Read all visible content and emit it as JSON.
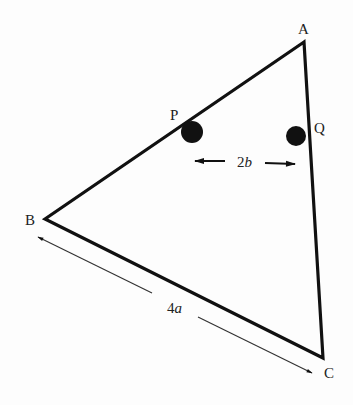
{
  "diagram": {
    "type": "triangle-with-charges",
    "vertices": {
      "A": {
        "label": "A",
        "x": 304,
        "y": 42
      },
      "B": {
        "label": "B",
        "x": 45,
        "y": 219
      },
      "C": {
        "label": "C",
        "x": 323,
        "y": 358
      }
    },
    "points": {
      "P": {
        "label": "P",
        "x": 192,
        "y": 132,
        "r": 11
      },
      "Q": {
        "label": "Q",
        "x": 296,
        "y": 136,
        "r": 10
      }
    },
    "dimensions": {
      "PQ": {
        "label_num": "2",
        "label_var": "b"
      },
      "BC": {
        "label_num": "4",
        "label_var": "a"
      }
    },
    "colors": {
      "line": "#111111",
      "ball": "#111111",
      "text": "#222222"
    }
  }
}
